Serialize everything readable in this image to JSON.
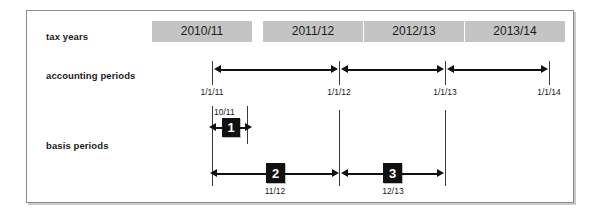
{
  "rows": {
    "tax_years_label": "tax years",
    "accounting_periods_label": "accounting periods",
    "basis_periods_label": "basis periods"
  },
  "tax_years": [
    {
      "label": "2010/11"
    },
    {
      "label": "2011/12"
    },
    {
      "label": "2012/13"
    },
    {
      "label": "2013/14"
    }
  ],
  "accounting_periods": {
    "dates": [
      {
        "label": "1/1/11"
      },
      {
        "label": "1/1/12"
      },
      {
        "label": "1/1/13"
      },
      {
        "label": "1/1/14"
      }
    ],
    "spans": [
      {
        "from": "1/1/11",
        "to": "1/1/12"
      },
      {
        "from": "1/1/12",
        "to": "1/1/13"
      },
      {
        "from": "1/1/13",
        "to": "1/1/14"
      }
    ]
  },
  "basis_periods": [
    {
      "number": "1",
      "caption": "10/11",
      "caption_position": "above"
    },
    {
      "number": "2",
      "caption": "11/12",
      "caption_position": "below"
    },
    {
      "number": "3",
      "caption": "12/13",
      "caption_position": "below"
    }
  ],
  "colors": {
    "tax_bar_fill": "#c4c4c4",
    "badge_fill": "#111111",
    "badge_text": "#ffffff",
    "line": "#111111",
    "frame_border": "#8a8a8a",
    "text": "#1b1b1b"
  }
}
